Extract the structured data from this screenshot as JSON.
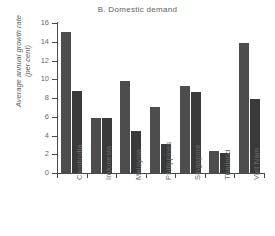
{
  "chart_data": {
    "type": "bar",
    "title": "B. Domestic demand",
    "xlabel": "",
    "ylabel": "Average annual growth rate\n(per cent)",
    "ylim": [
      0,
      16
    ],
    "yticks": [
      0,
      2,
      4,
      6,
      8,
      10,
      12,
      14,
      16
    ],
    "ytick_labels": [
      "0",
      "2",
      "4",
      "6",
      "8",
      "10",
      "12",
      "14",
      "16"
    ],
    "grid": false,
    "legend": "none",
    "categories": [
      "Cambodia",
      "Indonesia",
      "Malaysia",
      "Philippines",
      "Singapore",
      "Thailand",
      "Viet Nam"
    ],
    "series": [
      {
        "name": "Series 1",
        "color": "#4d4d4d",
        "values": [
          15.0,
          5.9,
          9.8,
          7.0,
          9.3,
          2.35,
          13.9
        ]
      },
      {
        "name": "Series 2",
        "color": "#3a3a3a",
        "values": [
          8.8,
          5.9,
          4.5,
          3.1,
          8.6,
          2.1,
          7.9
        ]
      }
    ]
  }
}
